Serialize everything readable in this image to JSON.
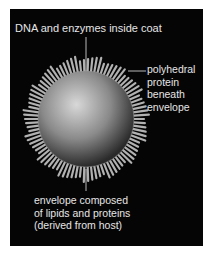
{
  "diagram": {
    "labels": {
      "top": "DNA and enzymes inside coat",
      "right": [
        "polyhedral",
        "protein",
        "beneath",
        "envelope"
      ],
      "bottom": [
        "envelope composed",
        "of lipids and proteins",
        "(derived from host)"
      ]
    },
    "colors": {
      "background": "#050505",
      "text": "#e6e6e6",
      "page": "#ffffff"
    }
  }
}
